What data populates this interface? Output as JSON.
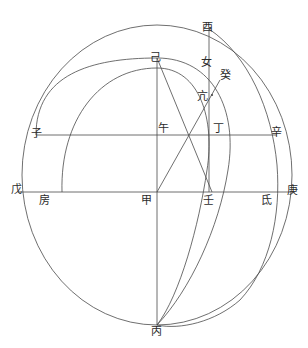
{
  "figure": {
    "background_color": "#ffffff",
    "stroke_color": "#444444",
    "label_color": "#2b2b2b",
    "stroke_width": 0.8,
    "width": 308,
    "height": 348
  },
  "labels": [
    {
      "id": "you",
      "text": "酉",
      "x": 207,
      "y": 27
    },
    {
      "id": "ji",
      "text": "己",
      "x": 155,
      "y": 57
    },
    {
      "id": "nv",
      "text": "女",
      "x": 206,
      "y": 62
    },
    {
      "id": "gui",
      "text": "癸",
      "x": 225,
      "y": 75
    },
    {
      "id": "kang",
      "text": "亢",
      "x": 202,
      "y": 96
    },
    {
      "id": "zi",
      "text": "子",
      "x": 36,
      "y": 133
    },
    {
      "id": "wu",
      "text": "午",
      "x": 163,
      "y": 128
    },
    {
      "id": "ding",
      "text": "丁",
      "x": 218,
      "y": 128
    },
    {
      "id": "xin",
      "text": "辛",
      "x": 276,
      "y": 132
    },
    {
      "id": "wu2",
      "text": "戊",
      "x": 16,
      "y": 189
    },
    {
      "id": "fang",
      "text": "房",
      "x": 44,
      "y": 200
    },
    {
      "id": "jia",
      "text": "甲",
      "x": 146,
      "y": 200
    },
    {
      "id": "ren",
      "text": "壬",
      "x": 208,
      "y": 200
    },
    {
      "id": "di",
      "text": "氐",
      "x": 266,
      "y": 200
    },
    {
      "id": "geng",
      "text": "庚",
      "x": 292,
      "y": 190
    },
    {
      "id": "bing",
      "text": "丙",
      "x": 156,
      "y": 331
    }
  ],
  "geometry": {
    "center": {
      "name": "甲",
      "x": 157,
      "y": 192
    },
    "outer_ellipse": {
      "cx": 157,
      "cy": 175,
      "rx": 135,
      "ry": 150
    },
    "mid_arc": {
      "from": "子",
      "to": "丙",
      "top": "己"
    },
    "inner_arc": {
      "from": "房",
      "to": "丙",
      "top": "己"
    },
    "horizontal_lines": [
      {
        "name": "子辛",
        "y": 135,
        "x1": 36,
        "x2": 277
      },
      {
        "name": "戊庚",
        "y": 192,
        "x1": 18,
        "x2": 295
      }
    ],
    "vertical_lines": [
      {
        "name": "己丙",
        "x": 157,
        "y1": 58,
        "y2": 325
      },
      {
        "name": "酉壬",
        "x": 209,
        "y1": 29,
        "y2": 192
      }
    ],
    "diagonals": [
      {
        "name": "己壬",
        "x1": 157,
        "y1": 58,
        "x2": 211,
        "y2": 192
      },
      {
        "name": "甲癸",
        "x1": 157,
        "y1": 192,
        "x2": 219,
        "y2": 82
      }
    ]
  }
}
